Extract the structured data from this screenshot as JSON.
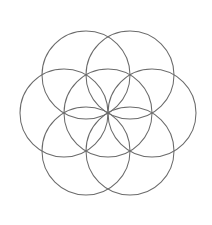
{
  "figure": {
    "kind": "sacred-geometry-diagram",
    "canvas": {
      "width": 212,
      "height": 225,
      "background_color": "#ffffff"
    },
    "stroke": {
      "color": "#6b6b6b",
      "width": 1.05,
      "fill": "none"
    },
    "geometry": {
      "center_x": 108,
      "center_y": 113,
      "radius": 44,
      "circle_count": 7,
      "arrangement": "hexagonal",
      "bounding_box": {
        "left": 20,
        "top": 25,
        "right": 196,
        "bottom": 201
      }
    },
    "circles": [
      {
        "name": "center-circle",
        "cx": 108,
        "cy": 113,
        "r": 44,
        "angle_deg": null
      },
      {
        "name": "circle-right",
        "cx": 152,
        "cy": 113,
        "r": 44,
        "angle_deg": 0
      },
      {
        "name": "circle-upper-right",
        "cx": 130,
        "cy": 75,
        "r": 44,
        "angle_deg": 60
      },
      {
        "name": "circle-upper-left",
        "cx": 86,
        "cy": 75,
        "r": 44,
        "angle_deg": 120
      },
      {
        "name": "circle-left",
        "cx": 64,
        "cy": 113,
        "r": 44,
        "angle_deg": 180
      },
      {
        "name": "circle-lower-left",
        "cx": 86,
        "cy": 151,
        "r": 44,
        "angle_deg": 240
      },
      {
        "name": "circle-lower-right",
        "cx": 130,
        "cy": 151,
        "r": 44,
        "angle_deg": 300
      }
    ]
  }
}
